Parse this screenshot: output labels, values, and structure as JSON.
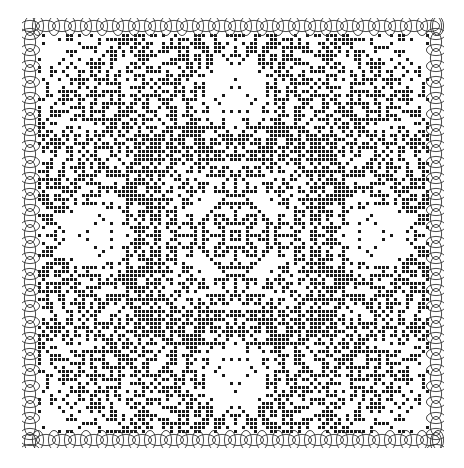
{
  "figure": {
    "colors": {
      "ink": "#1a1a1a",
      "paper": "#ffffff"
    },
    "symmetry": "4-fold (D4)",
    "border_motif": "interlocking petal loops",
    "caption_visible": false,
    "caption": ""
  }
}
